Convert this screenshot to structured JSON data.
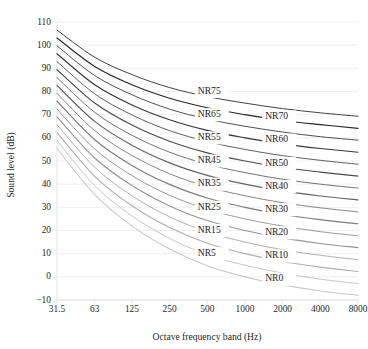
{
  "chart_data": {
    "type": "line",
    "title": "",
    "xlabel": "Octave frequency band (Hz)",
    "ylabel": "Sound level (dB)",
    "x": [
      31.5,
      63,
      125,
      250,
      500,
      1000,
      2000,
      4000,
      8000
    ],
    "xtick_labels": [
      "31.5",
      "63",
      "125",
      "250",
      "500",
      "1000",
      "2000",
      "4000",
      "8000"
    ],
    "xscale": "log",
    "xlim": [
      31.5,
      8000
    ],
    "ylim": [
      -10,
      110
    ],
    "yticks": [
      -10,
      0,
      10,
      20,
      30,
      40,
      50,
      60,
      70,
      80,
      90,
      100,
      110
    ],
    "ytick_labels": [
      "−10",
      "0",
      "10",
      "20",
      "30",
      "40",
      "50",
      "60",
      "70",
      "80",
      "90",
      "100",
      "110"
    ],
    "grid": true,
    "grid_axis": "y",
    "legend": "inline-labels",
    "series": [
      {
        "name": "NR0",
        "label": "NR0",
        "color": "#c9c9cd",
        "values": [
          55.4,
          35.5,
          22.0,
          12.0,
          4.8,
          0.0,
          -3.5,
          -6.1,
          -8.0
        ]
      },
      {
        "name": "NR5",
        "label": "NR5",
        "color": "#bcbcc1",
        "values": [
          58.8,
          39.4,
          26.3,
          16.6,
          9.6,
          5.0,
          1.6,
          -1.0,
          -2.9
        ]
      },
      {
        "name": "NR10",
        "label": "NR10",
        "color": "#aeaeb4",
        "values": [
          62.2,
          43.4,
          30.7,
          21.3,
          14.5,
          10.0,
          6.6,
          4.2,
          2.3
        ]
      },
      {
        "name": "NR15",
        "label": "NR15",
        "color": "#a2a2a8",
        "values": [
          65.6,
          47.3,
          35.0,
          25.9,
          19.4,
          15.0,
          11.7,
          9.3,
          7.4
        ]
      },
      {
        "name": "NR20",
        "label": "NR20",
        "color": "#95959c",
        "values": [
          69.0,
          51.3,
          39.4,
          30.6,
          24.3,
          20.0,
          16.8,
          14.4,
          12.6
        ]
      },
      {
        "name": "NR25",
        "label": "NR25",
        "color": "#88888f",
        "values": [
          72.4,
          55.2,
          43.7,
          35.2,
          29.2,
          25.0,
          21.9,
          19.5,
          17.7
        ]
      },
      {
        "name": "NR30",
        "label": "NR30",
        "color": "#7b7b83",
        "values": [
          75.8,
          59.2,
          48.1,
          39.9,
          34.0,
          30.0,
          26.9,
          24.7,
          22.9
        ]
      },
      {
        "name": "NR35",
        "label": "NR35",
        "color": "#6e6e77",
        "values": [
          79.2,
          63.1,
          52.4,
          44.5,
          38.9,
          35.0,
          32.0,
          29.8,
          28.0
        ]
      },
      {
        "name": "NR40",
        "label": "NR40",
        "color": "#62626b",
        "values": [
          82.6,
          67.1,
          56.8,
          49.2,
          43.8,
          40.0,
          37.1,
          34.9,
          33.2
        ]
      },
      {
        "name": "NR45",
        "label": "NR45",
        "color": "#56565f",
        "values": [
          86.0,
          71.0,
          61.1,
          53.8,
          48.6,
          45.0,
          42.1,
          40.0,
          38.3
        ]
      },
      {
        "name": "NR50",
        "label": "NR50",
        "color": "#4a4a54",
        "values": [
          89.4,
          75.0,
          65.5,
          58.5,
          53.5,
          50.0,
          47.2,
          45.2,
          43.5
        ]
      },
      {
        "name": "NR55",
        "label": "NR55",
        "color": "#404049",
        "values": [
          92.9,
          79.0,
          69.9,
          63.1,
          58.4,
          55.0,
          52.3,
          50.3,
          48.6
        ]
      },
      {
        "name": "NR60",
        "label": "NR60",
        "color": "#36363f",
        "values": [
          96.3,
          82.9,
          74.2,
          67.8,
          63.2,
          60.0,
          57.4,
          55.4,
          53.8
        ]
      },
      {
        "name": "NR65",
        "label": "NR65",
        "color": "#2e2e36",
        "values": [
          99.7,
          86.9,
          78.6,
          72.4,
          68.1,
          65.0,
          62.5,
          60.5,
          59.0
        ]
      },
      {
        "name": "NR70",
        "label": "NR70",
        "color": "#26262e",
        "values": [
          103.1,
          90.8,
          82.9,
          77.1,
          73.0,
          70.0,
          67.5,
          65.7,
          64.1
        ]
      },
      {
        "name": "NR75",
        "label": "NR75",
        "color": "#1f1f26",
        "values": [
          106.5,
          94.8,
          87.3,
          81.7,
          77.8,
          75.0,
          72.6,
          70.8,
          69.3
        ]
      }
    ],
    "inline_label_positions": [
      {
        "label": "NR75",
        "x_hz": 420,
        "y_db": 80
      },
      {
        "label": "NR65",
        "x_hz": 420,
        "y_db": 70
      },
      {
        "label": "NR55",
        "x_hz": 420,
        "y_db": 60
      },
      {
        "label": "NR45",
        "x_hz": 420,
        "y_db": 50
      },
      {
        "label": "NR35",
        "x_hz": 420,
        "y_db": 40
      },
      {
        "label": "NR25",
        "x_hz": 420,
        "y_db": 30
      },
      {
        "label": "NR15",
        "x_hz": 420,
        "y_db": 20
      },
      {
        "label": "NR5",
        "x_hz": 420,
        "y_db": 10
      },
      {
        "label": "NR70",
        "x_hz": 1450,
        "y_db": 69
      },
      {
        "label": "NR60",
        "x_hz": 1450,
        "y_db": 59
      },
      {
        "label": "NR50",
        "x_hz": 1450,
        "y_db": 49
      },
      {
        "label": "NR40",
        "x_hz": 1450,
        "y_db": 39
      },
      {
        "label": "NR30",
        "x_hz": 1450,
        "y_db": 29
      },
      {
        "label": "NR20",
        "x_hz": 1450,
        "y_db": 19
      },
      {
        "label": "NR10",
        "x_hz": 1450,
        "y_db": 9
      },
      {
        "label": "NR0",
        "x_hz": 1450,
        "y_db": -1
      }
    ]
  }
}
